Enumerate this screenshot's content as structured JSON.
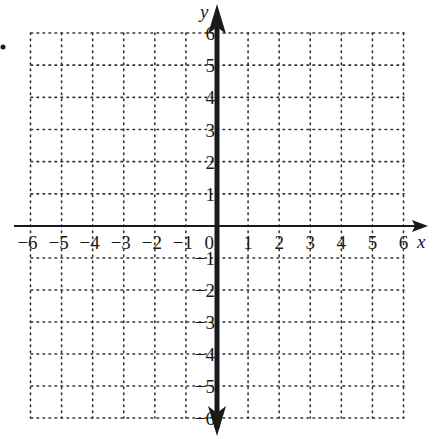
{
  "chart_data": {
    "type": "scatter",
    "title": "",
    "xlabel": "x",
    "ylabel": "y",
    "xlim": [
      -6,
      6
    ],
    "ylim": [
      -6,
      6
    ],
    "grid": true,
    "grid_style": "dotted",
    "x_ticks": [
      "-6",
      "-5",
      "-4",
      "-3",
      "-2",
      "-1",
      "0",
      "1",
      "2",
      "3",
      "4",
      "5",
      "6"
    ],
    "y_ticks": [
      "6",
      "5",
      "4",
      "3",
      "2",
      "1",
      "-1",
      "-2",
      "-3",
      "-4",
      "-5",
      "-6"
    ],
    "series": [],
    "annotations": [],
    "legend": null
  },
  "labels": {
    "x_axis": "x",
    "y_axis": "y",
    "origin": "0"
  },
  "colors": {
    "axis": "#1a1a1a",
    "grid": "#333333",
    "text": "#1a1a1a",
    "background": "#ffffff"
  }
}
